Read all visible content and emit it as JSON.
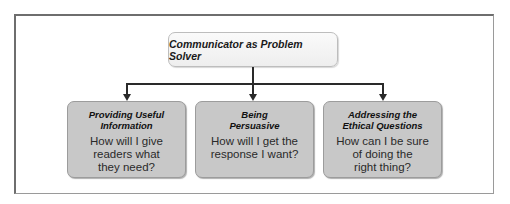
{
  "diagram": {
    "root": {
      "label": "Communicator as Problem Solver"
    },
    "children": [
      {
        "title_line1": "Providing Useful",
        "title_line2": "Information",
        "question_lines": [
          "How will I give",
          "readers what",
          "they need?"
        ]
      },
      {
        "title_line1": "Being",
        "title_line2": "Persuasive",
        "question_lines": [
          "How will I get the",
          "response I want?"
        ]
      },
      {
        "title_line1": "Addressing the",
        "title_line2": "Ethical Questions",
        "question_lines": [
          "How can I be sure",
          "of doing the",
          "right thing?"
        ]
      }
    ],
    "colors": {
      "child_fill": "#c8c8c8",
      "root_fill": "#f3f3f3",
      "connector": "#2a2a2a"
    }
  }
}
